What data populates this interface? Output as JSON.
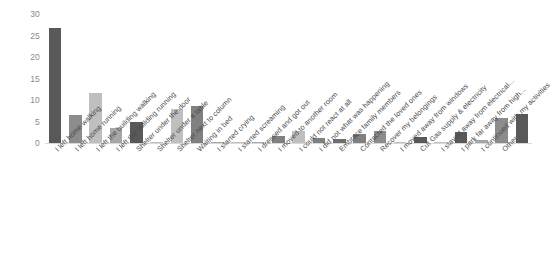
{
  "chart_data": {
    "type": "bar",
    "title": "",
    "subtitle": "",
    "xlabel": "",
    "ylabel": "",
    "ylim": [
      0,
      30
    ],
    "yticks": [
      0,
      5,
      10,
      15,
      20,
      25,
      30
    ],
    "grid": false,
    "legend": "none",
    "categories": [
      "I left home walking",
      "I left home running",
      "I left the building walking",
      "I left the building running",
      "Shelter under the door",
      "Shelter under a table",
      "Shelter next to column",
      "Waiting in bed",
      "I started crying",
      "I started screaming",
      "I dressed and got out",
      "I moved to another room",
      "I could not react at all",
      "I did not what was happening",
      "Embrace family members",
      "Contacted the loved ones",
      "Recover my belongings",
      "I moved away from windows",
      "Cut Gas supply & electricity",
      "I stayed away from electrical...",
      "I park far away from high...",
      "I continued with my activities",
      "Other"
    ],
    "values": [
      26.8,
      6.6,
      11.6,
      3.4,
      4.9,
      0.2,
      7.9,
      8.7,
      0.3,
      0.3,
      0.2,
      1.6,
      2.9,
      1.2,
      1.0,
      2.0,
      2.8,
      0.3,
      1.4,
      0.3,
      2.6,
      0.6,
      5.8
    ],
    "colors": [
      "#595959",
      "#8c8c8c",
      "#bfbfbf",
      "#a6a6a6",
      "#595959",
      "#bfbfbf",
      "#bfbfbf",
      "#808080",
      "#a6a6a6",
      "#bfbfbf",
      "#a6a6a6",
      "#808080",
      "#bfbfbf",
      "#808080",
      "#6e6e6e",
      "#808080",
      "#8c8c8c",
      "#bfbfbf",
      "#595959",
      "#bfbfbf",
      "#595959",
      "#a6a6a6",
      "#8c8c8c"
    ],
    "last_bar": {
      "category": "Other",
      "value": 6.8,
      "color": "#595959"
    },
    "axis_color": "#d9d9d9",
    "tick_label_color": "#8a8a8a",
    "category_label_color": "#4a4a4a"
  }
}
